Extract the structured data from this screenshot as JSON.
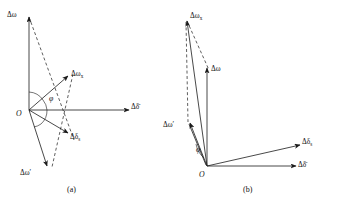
{
  "figure": {
    "background_color": "#ffffff",
    "line_color": "#1a1a1a",
    "panels": [
      {
        "id": "a",
        "caption": "(a)",
        "origin_label": "O",
        "angle_label": "φ",
        "labels": {
          "delta_omega_top": "Δω",
          "delta_omega_x": "Δω",
          "delta_omega_x_sub": "x",
          "delta_delta_bar": "Δδ̄",
          "delta_delta_s": "Δδ",
          "delta_delta_s_sub": "s",
          "delta_omega_prime": "Δω′"
        }
      },
      {
        "id": "b",
        "caption": "(b)",
        "origin_label": "O",
        "angle_label": "φ",
        "labels": {
          "delta_omega_x": "Δω",
          "delta_omega_x_sub": "x",
          "delta_omega": "Δω",
          "delta_omega_prime": "Δω′",
          "delta_delta_s": "Δδ",
          "delta_delta_s_sub": "s",
          "delta_delta_bar": "Δδ̄"
        }
      }
    ]
  }
}
